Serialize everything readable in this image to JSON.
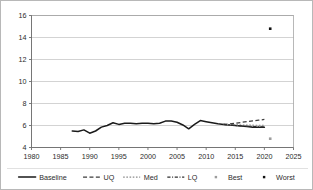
{
  "chart_data": {
    "type": "line",
    "title": "",
    "xlabel": "",
    "ylabel": "",
    "xlim": [
      1980,
      2025
    ],
    "ylim": [
      4,
      16
    ],
    "grid": true,
    "legend_position": "bottom",
    "xticks": [
      1980,
      1985,
      1990,
      1995,
      2000,
      2005,
      2010,
      2015,
      2020,
      2025
    ],
    "yticks": [
      4,
      6,
      8,
      10,
      12,
      14,
      16
    ],
    "series": [
      {
        "name": "Baseline",
        "style": "solid",
        "color": "#1a1a1a",
        "x": [
          1987,
          1988,
          1989,
          1990,
          1991,
          1992,
          1993,
          1994,
          1995,
          1996,
          1997,
          1998,
          1999,
          2000,
          2001,
          2002,
          2003,
          2004,
          2005,
          2006,
          2007,
          2008,
          2009,
          2010,
          2011,
          2012,
          2013,
          2014,
          2015,
          2016,
          2017,
          2018,
          2019,
          2020
        ],
        "values": [
          5.5,
          5.45,
          5.6,
          5.3,
          5.5,
          5.85,
          6.0,
          6.25,
          6.1,
          6.2,
          6.2,
          6.15,
          6.2,
          6.2,
          6.15,
          6.2,
          6.4,
          6.4,
          6.3,
          6.05,
          5.7,
          6.1,
          6.45,
          6.35,
          6.25,
          6.15,
          6.1,
          6.05,
          6.0,
          5.95,
          5.9,
          5.85,
          5.85,
          5.85
        ]
      },
      {
        "name": "UQ",
        "style": "dashed",
        "color": "#3d3d3d",
        "x": [
          2013,
          2014,
          2015,
          2016,
          2017,
          2018,
          2019,
          2020
        ],
        "values": [
          6.1,
          6.15,
          6.2,
          6.28,
          6.35,
          6.42,
          6.48,
          6.55
        ]
      },
      {
        "name": "Med",
        "style": "dotted",
        "color": "#8a8a8a",
        "x": [
          2013,
          2014,
          2015,
          2016,
          2017,
          2018,
          2019,
          2020
        ],
        "values": [
          6.1,
          6.08,
          6.06,
          6.05,
          6.04,
          6.03,
          6.02,
          6.02
        ]
      },
      {
        "name": "LQ",
        "style": "dash-dot",
        "color": "#2e2e2e",
        "x": [
          2013,
          2014,
          2015,
          2016,
          2017,
          2018,
          2019,
          2020
        ],
        "values": [
          6.1,
          6.04,
          6.0,
          5.96,
          5.93,
          5.9,
          5.88,
          5.87
        ]
      }
    ],
    "points": [
      {
        "name": "Best",
        "style": "marker",
        "color": "#9d9d9d",
        "x": [
          2021
        ],
        "values": [
          4.8
        ]
      },
      {
        "name": "Worst",
        "style": "marker",
        "color": "#111111",
        "x": [
          2021
        ],
        "values": [
          14.8
        ]
      }
    ],
    "legend": [
      {
        "label": "Baseline",
        "style": "solid"
      },
      {
        "label": "UQ",
        "style": "dashed"
      },
      {
        "label": "Med",
        "style": "dotted"
      },
      {
        "label": "LQ",
        "style": "dash-dot"
      },
      {
        "label": "Best",
        "style": "marker-light"
      },
      {
        "label": "Worst",
        "style": "marker-dark"
      }
    ]
  },
  "colors": {
    "baseline": "#1a1a1a",
    "uq": "#3d3d3d",
    "med": "#8a8a8a",
    "lq": "#2e2e2e",
    "best": "#9d9d9d",
    "worst": "#111111",
    "grid": "#b5b5b5",
    "axis": "#6e6e6e",
    "frame": "#9a9a9a",
    "background": "#ffffff"
  }
}
